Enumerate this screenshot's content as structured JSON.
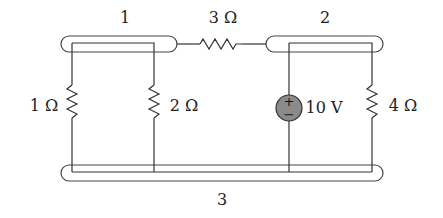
{
  "diagram": {
    "type": "circuit-schematic",
    "nodes": [
      {
        "id": "node-1",
        "label": "1"
      },
      {
        "id": "node-2",
        "label": "2"
      },
      {
        "id": "node-3",
        "label": "3"
      }
    ],
    "components": [
      {
        "id": "R3",
        "kind": "resistor",
        "label": "3 Ω",
        "between": [
          "1",
          "2"
        ]
      },
      {
        "id": "R1",
        "kind": "resistor",
        "label": "1 Ω",
        "between": [
          "1",
          "3"
        ]
      },
      {
        "id": "R2",
        "kind": "resistor",
        "label": "2 Ω",
        "between": [
          "1",
          "3"
        ]
      },
      {
        "id": "V1",
        "kind": "voltage-source",
        "label": "10 V",
        "between": [
          "2",
          "3"
        ],
        "plus": "+",
        "minus": "−",
        "fill": "#8a8a8a"
      },
      {
        "id": "R4",
        "kind": "resistor",
        "label": "4 Ω",
        "between": [
          "2",
          "3"
        ]
      }
    ]
  }
}
